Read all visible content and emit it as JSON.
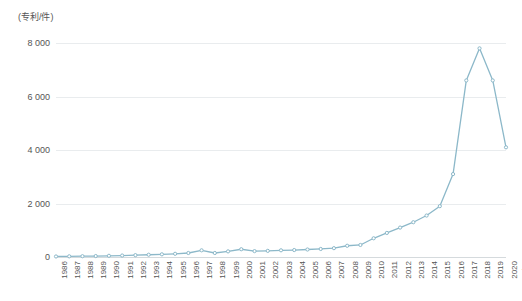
{
  "chart_data": {
    "type": "line",
    "title": "",
    "subtitle": "",
    "xlabel": "(年)",
    "ylabel": "(专利/件)",
    "xlim": [
      1986,
      2020
    ],
    "ylim": [
      0,
      8000
    ],
    "grid": true,
    "legend": false,
    "legend_position": "none",
    "line_color": "#8cb8c9",
    "marker_color": "#8cb8c9",
    "y_ticks": [
      0,
      2000,
      4000,
      6000,
      8000
    ],
    "y_tick_labels": [
      "0",
      "2 000",
      "4 000",
      "6 000",
      "8 000"
    ],
    "categories": [
      "1986",
      "1987",
      "1988",
      "1989",
      "1990",
      "1991",
      "1992",
      "1993",
      "1994",
      "1995",
      "1996",
      "1997",
      "1998",
      "1999",
      "2000",
      "2001",
      "2002",
      "2003",
      "2004",
      "2005",
      "2006",
      "2007",
      "2008",
      "2009",
      "2010",
      "2011",
      "2012",
      "2013",
      "2014",
      "2015",
      "2016",
      "2017",
      "2018",
      "2019",
      "2020"
    ],
    "series": [
      {
        "name": "专利申请量",
        "values": [
          20,
          25,
          30,
          35,
          45,
          55,
          70,
          85,
          100,
          120,
          150,
          250,
          150,
          210,
          290,
          220,
          230,
          250,
          260,
          280,
          300,
          330,
          420,
          450,
          700,
          900,
          1100,
          1300,
          1550,
          1900,
          3100,
          6600,
          7800,
          6600,
          4100
        ]
      }
    ]
  },
  "axes": {
    "y_unit_label": "(专利/件)",
    "x_unit_label": "(年)"
  }
}
